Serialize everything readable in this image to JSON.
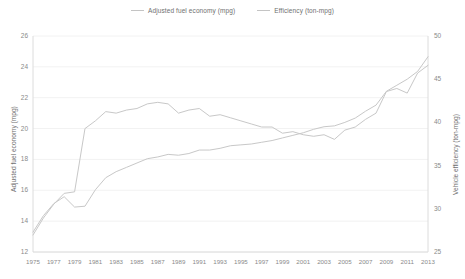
{
  "legend": {
    "position": "top-center",
    "items": [
      {
        "name": "series-fuel-economy",
        "label": "Adjusted fuel economy (mpg)",
        "color": "#c4c4c4"
      },
      {
        "name": "series-efficiency",
        "label": "Efficiency (ton-mpg)",
        "color": "#c4c4c4"
      }
    ]
  },
  "axes": {
    "left": {
      "label": "Adjusted fuel economy (mpg)",
      "min": 12,
      "max": 26,
      "step": 2,
      "ticks": [
        "12",
        "14",
        "16",
        "18",
        "20",
        "22",
        "24",
        "26"
      ]
    },
    "right": {
      "label": "Vehicle efficiency (ton-mpg)",
      "min": 25,
      "max": 50,
      "step": 5,
      "ticks": [
        "25",
        "30",
        "35",
        "40",
        "45",
        "50"
      ]
    },
    "bottom": {
      "label": "",
      "ticks": [
        "1975",
        "1977",
        "1979",
        "1981",
        "1983",
        "1985",
        "1987",
        "1989",
        "1991",
        "1993",
        "1995",
        "1997",
        "1999",
        "2001",
        "2003",
        "2005",
        "2007",
        "2009",
        "2011",
        "2013"
      ]
    }
  },
  "colors": {
    "line": "#c8c8c8",
    "grid": "#f2f2f2",
    "axis": "#dcdcdc",
    "text": "#7a7a7a",
    "background": "#ffffff"
  },
  "chart_data": {
    "type": "line",
    "title": "",
    "xlabel": "",
    "ylabel": "Adjusted fuel economy (mpg)",
    "y2label": "Vehicle efficiency (ton-mpg)",
    "ylim": [
      12,
      26
    ],
    "y2lim": [
      25,
      50
    ],
    "xlim": [
      1975,
      2013
    ],
    "grid": true,
    "legend_position": "top-center",
    "x": [
      1975,
      1976,
      1977,
      1978,
      1979,
      1980,
      1981,
      1982,
      1983,
      1984,
      1985,
      1986,
      1987,
      1988,
      1989,
      1990,
      1991,
      1992,
      1993,
      1994,
      1995,
      1996,
      1997,
      1998,
      1999,
      2000,
      2001,
      2002,
      2003,
      2004,
      2005,
      2006,
      2007,
      2008,
      2009,
      2010,
      2011,
      2012,
      2013
    ],
    "series": [
      {
        "name": "Adjusted fuel economy (mpg)",
        "axis": "left",
        "unit": "mpg",
        "color": "#c8c8c8",
        "values": [
          13.1,
          14.2,
          15.1,
          15.8,
          15.9,
          20.0,
          20.5,
          21.1,
          21.0,
          21.2,
          21.3,
          21.6,
          21.7,
          21.6,
          21.0,
          21.2,
          21.3,
          20.8,
          20.9,
          20.7,
          20.5,
          20.3,
          20.1,
          20.1,
          19.7,
          19.8,
          19.6,
          19.5,
          19.6,
          19.3,
          19.9,
          20.1,
          20.6,
          21.0,
          22.4,
          22.6,
          22.3,
          23.6,
          24.1
        ]
      },
      {
        "name": "Efficiency (ton-mpg)",
        "axis": "right",
        "unit": "ton-mpg",
        "color": "#c8c8c8",
        "values": [
          27.3,
          29.2,
          30.6,
          31.4,
          30.2,
          30.3,
          32.2,
          33.6,
          34.3,
          34.8,
          35.3,
          35.8,
          36.0,
          36.3,
          36.2,
          36.4,
          36.8,
          36.8,
          37.0,
          37.3,
          37.4,
          37.5,
          37.7,
          37.9,
          38.2,
          38.5,
          38.8,
          39.2,
          39.5,
          39.6,
          40.0,
          40.5,
          41.3,
          42.0,
          43.6,
          44.3,
          45.0,
          45.9,
          47.6
        ]
      }
    ]
  }
}
